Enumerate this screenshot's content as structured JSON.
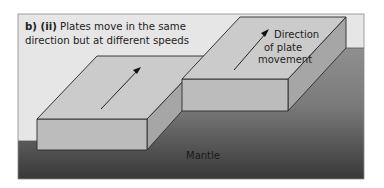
{
  "caption": {
    "label": "b) (ii)",
    "line1": "Plates move in the same",
    "line2": "direction but at different speeds"
  },
  "labels": {
    "direction_line1": "Direction",
    "direction_line2": "of plate",
    "direction_line3": "movement",
    "mantle": "Mantle"
  },
  "colors": {
    "sky": "#e4e4e4",
    "plate_top": "#c9c9c9",
    "plate_front": "#b8b8b8",
    "plate_side": "#a3a3a3",
    "mantle_top": "#8c8c8c",
    "mantle_bottom": "#3a3a3a",
    "outline": "#2a2a2a"
  }
}
